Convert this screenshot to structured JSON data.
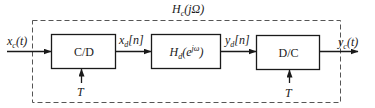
{
  "diagram": {
    "overall_system": {
      "label_main": "H",
      "label_sub": "c",
      "label_arg": "(jΩ)"
    },
    "input": {
      "main": "x",
      "sub": "c",
      "arg": "(t)"
    },
    "output": {
      "main": "y",
      "sub": "c",
      "arg": "(t)"
    },
    "blocks": [
      {
        "id": "cd",
        "label": "C/D",
        "control": "T"
      },
      {
        "id": "hd",
        "label_main": "H",
        "label_sub": "d",
        "label_arg_open": "(e",
        "label_sup": "jω",
        "label_arg_close": ")"
      },
      {
        "id": "dc",
        "label": "D/C",
        "control": "T"
      }
    ],
    "signals": [
      {
        "main": "x",
        "sub": "d",
        "arg": "[n]"
      },
      {
        "main": "y",
        "sub": "d",
        "arg": "[n]"
      }
    ],
    "colors": {
      "stroke": "#1a1a1a",
      "dashed": "#555555",
      "background": "#ffffff"
    }
  }
}
